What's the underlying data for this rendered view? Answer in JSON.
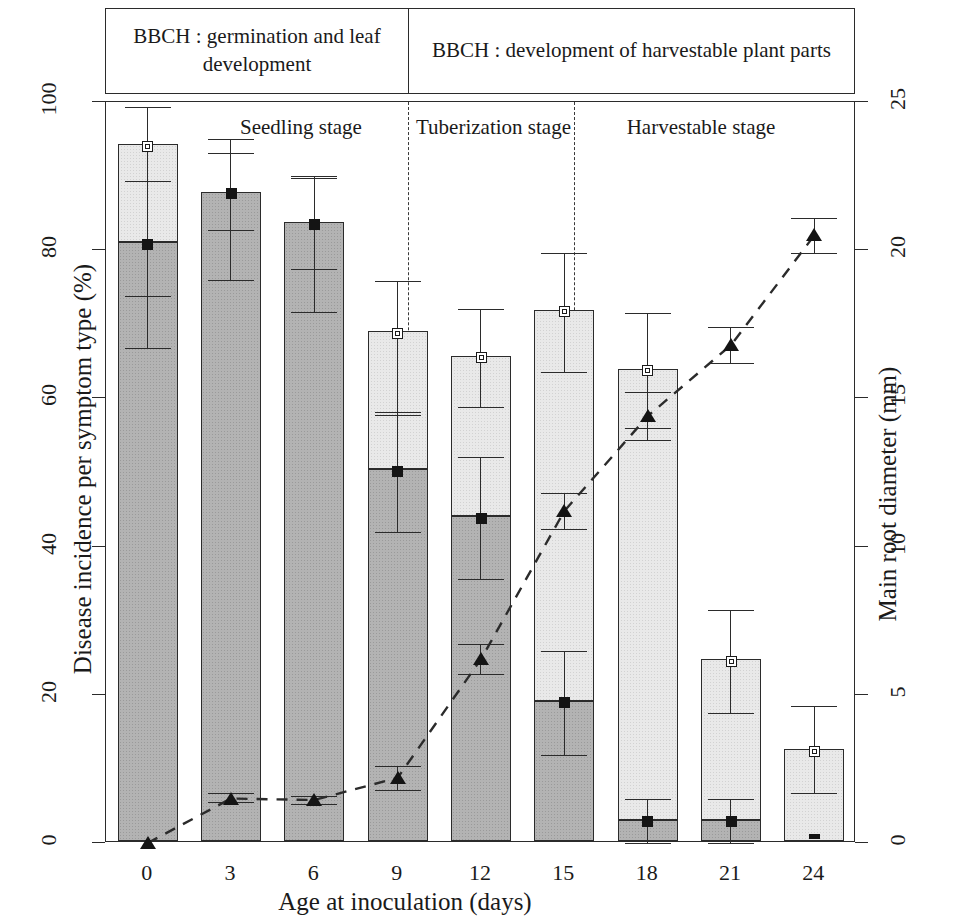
{
  "header_boxes": [
    {
      "text": "BBCH : germination and leaf  development"
    },
    {
      "text": "BBCH : development of harvestable plant parts"
    }
  ],
  "stage_labels": [
    {
      "text": "Seedling stage"
    },
    {
      "text": "Tuberization stage"
    },
    {
      "text": "Harvestable stage"
    }
  ],
  "axes": {
    "left_title": "Disease incidence per symptom type (%)",
    "right_title": "Main root diameter (mm)",
    "x_title": "Age at inoculation (days)",
    "left_ticks": [
      "0",
      "20",
      "40",
      "60",
      "80",
      "100"
    ],
    "right_ticks": [
      "0",
      "5",
      "10",
      "15",
      "20",
      "25"
    ],
    "x_ticks": [
      "0",
      "3",
      "6",
      "9",
      "12",
      "15",
      "18",
      "21",
      "24"
    ]
  },
  "colors": {
    "dark_segment": "#b3b3b3",
    "light_segment": "#e9e9e9",
    "outline": "#2b2b2b",
    "marker": "#141414"
  },
  "chart_data": {
    "type": "bar",
    "title": "",
    "xlabel": "Age at inoculation (days)",
    "ylabel": "Disease incidence per symptom type (%)",
    "y2label": "Main root diameter (mm)",
    "ylim": [
      0,
      100
    ],
    "y2lim": [
      0,
      25
    ],
    "grid": false,
    "legend": "none",
    "categories": [
      "0",
      "3",
      "6",
      "9",
      "12",
      "15",
      "18",
      "21",
      "24"
    ],
    "series": [
      {
        "name": "Total disease incidence (open square, left axis)",
        "marker": "open-square",
        "values": [
          94.0,
          87.6,
          83.5,
          68.8,
          65.5,
          71.7,
          63.7,
          24.5,
          12.4
        ],
        "err_low": [
          73.8,
          82.7,
          77.5,
          57.8,
          58.9,
          63.6,
          56.0,
          17.6,
          6.7
        ],
        "err_high": [
          99.3,
          93.1,
          89.8,
          75.9,
          72.0,
          79.6,
          71.5,
          31.5,
          18.5
        ]
      },
      {
        "name": "Dark (lower) symptom type incidence (filled square, left axis)",
        "marker": "filled-square",
        "values": [
          80.8,
          87.6,
          83.5,
          50.2,
          43.8,
          18.9,
          2.9,
          2.9,
          0.3
        ],
        "err_low": [
          66.8,
          76.0,
          71.6,
          42.0,
          35.6,
          11.9,
          0.0,
          0.0,
          0.0
        ],
        "err_high": [
          89.4,
          95.0,
          90.0,
          58.1,
          52.1,
          25.9,
          5.9,
          5.9,
          0.6
        ],
        "bar_dark_top": [
          80.8,
          87.6,
          83.5,
          50.2,
          43.8,
          18.9,
          2.9,
          2.9,
          0.0
        ],
        "bar_total_top": [
          94.0,
          87.6,
          83.5,
          68.8,
          65.5,
          71.7,
          63.7,
          24.5,
          12.4
        ]
      },
      {
        "name": "Main root diameter (triangle, right axis, dashed line)",
        "marker": "triangle",
        "axis": "right",
        "values": [
          0.0,
          1.5,
          1.45,
          2.2,
          6.2,
          11.2,
          14.4,
          16.8,
          20.5
        ],
        "err_low": [
          0.0,
          1.4,
          1.3,
          1.8,
          5.7,
          10.6,
          13.6,
          16.2,
          19.9
        ],
        "err_high": [
          0.0,
          1.7,
          1.6,
          2.6,
          6.7,
          11.8,
          15.2,
          17.4,
          21.1
        ]
      }
    ],
    "annotations": [
      "BBCH : germination and leaf  development",
      "BBCH : development of harvestable plant parts",
      "Seedling stage",
      "Tuberization stage",
      "Harvestable stage"
    ],
    "separators_at": [
      "9",
      "15"
    ]
  }
}
